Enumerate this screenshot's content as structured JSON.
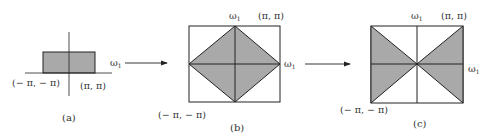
{
  "figure": {
    "colors": {
      "fill": "#a9a9a9",
      "stroke": "#222222",
      "background": "#ffffff"
    },
    "panels": [
      {
        "id": "a",
        "caption": "(a)",
        "axis_label": "ω",
        "axis_label_sub": "1",
        "corner_low": "(− π, − π)",
        "corner_high": "(π, π)"
      },
      {
        "id": "b",
        "caption": "(b)",
        "top_label": "ω",
        "top_label_sub": "1",
        "right_label": "ω",
        "right_label_sub": "1",
        "corner_low": "(− π, − π)",
        "corner_high": "(π, π)"
      },
      {
        "id": "c",
        "caption": "(c)",
        "top_label": "ω",
        "top_label_sub": "1",
        "right_label": "ω",
        "right_label_sub": "1",
        "corner_low": "(− π, − π)",
        "corner_high": "(π, π)"
      }
    ],
    "arrows": [
      {
        "from": "a",
        "to": "b"
      },
      {
        "from": "b",
        "to": "c"
      }
    ]
  }
}
